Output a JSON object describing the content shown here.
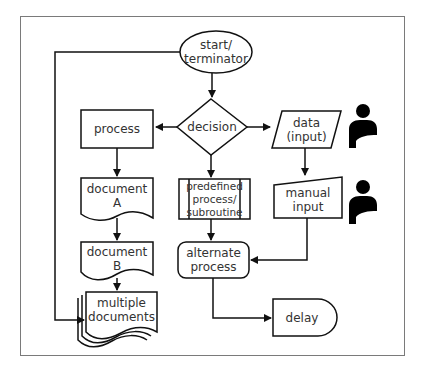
{
  "diagram": {
    "colors": {
      "stroke": "#111111",
      "text": "#333333",
      "frame": "#7a7a7a",
      "icon": "#000000",
      "background": "#ffffff"
    },
    "nodes": {
      "start": {
        "label_line1": "start/",
        "label_line2": "terminator",
        "shape": "ellipse"
      },
      "decision": {
        "label": "decision",
        "shape": "diamond"
      },
      "process": {
        "label": "process",
        "shape": "rectangle"
      },
      "data": {
        "label_line1": "data",
        "label_line2": "(input)",
        "shape": "parallelogram"
      },
      "document_a": {
        "label_line1": "document",
        "label_line2": "A",
        "shape": "document"
      },
      "predefined": {
        "label_line1": "predefined",
        "label_line2": "process/",
        "label_line3": "subroutine",
        "shape": "predefined-process"
      },
      "manual_input": {
        "label_line1": "manual",
        "label_line2": "input",
        "shape": "manual-input"
      },
      "document_b": {
        "label_line1": "document",
        "label_line2": "B",
        "shape": "document"
      },
      "alternate": {
        "label_line1": "alternate",
        "label_line2": "process",
        "shape": "rounded-rectangle"
      },
      "multiple_documents": {
        "label_line1": "multiple",
        "label_line2": "documents",
        "shape": "multi-document"
      },
      "delay": {
        "label": "delay",
        "shape": "delay"
      }
    },
    "icons": [
      {
        "name": "person-icon",
        "near": "data"
      },
      {
        "name": "person-icon",
        "near": "manual_input"
      }
    ],
    "edges": [
      {
        "from": "start",
        "to": "decision"
      },
      {
        "from": "start",
        "to": "multiple_documents"
      },
      {
        "from": "decision",
        "to": "process"
      },
      {
        "from": "decision",
        "to": "data"
      },
      {
        "from": "decision",
        "to": "predefined"
      },
      {
        "from": "process",
        "to": "document_a"
      },
      {
        "from": "document_a",
        "to": "document_b"
      },
      {
        "from": "document_b",
        "to": "multiple_documents"
      },
      {
        "from": "data",
        "to": "manual_input"
      },
      {
        "from": "predefined",
        "to": "alternate"
      },
      {
        "from": "manual_input",
        "to": "alternate"
      },
      {
        "from": "alternate",
        "to": "delay"
      }
    ]
  }
}
